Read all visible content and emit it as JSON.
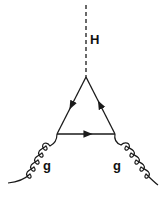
{
  "diagram": {
    "type": "feynman",
    "colors": {
      "line": "#1a1a1a",
      "background": "#ffffff"
    },
    "labels": {
      "higgs": "H",
      "gluon_left": "g",
      "gluon_right": "g"
    },
    "vertices": {
      "top": [
        86,
        77
      ],
      "left": [
        57,
        134
      ],
      "right": [
        115,
        134
      ]
    },
    "propagators": [
      {
        "name": "higgs",
        "style": "dashed",
        "from": [
          86,
          5
        ],
        "to": [
          86,
          77
        ]
      },
      {
        "name": "quark-left",
        "style": "solid-arrow",
        "from": [
          86,
          77
        ],
        "to": [
          57,
          134
        ],
        "arrow": "toward-left-vertex"
      },
      {
        "name": "quark-bottom",
        "style": "solid-arrow",
        "from": [
          57,
          134
        ],
        "to": [
          115,
          134
        ],
        "arrow": "rightward"
      },
      {
        "name": "quark-right",
        "style": "solid-arrow",
        "from": [
          115,
          134
        ],
        "to": [
          86,
          77
        ],
        "arrow": "toward-top-vertex"
      },
      {
        "name": "gluon-left",
        "style": "curly",
        "from": [
          57,
          134
        ],
        "to": [
          8,
          183
        ]
      },
      {
        "name": "gluon-right",
        "style": "curly",
        "from": [
          115,
          134
        ],
        "to": [
          158,
          185
        ]
      }
    ]
  }
}
